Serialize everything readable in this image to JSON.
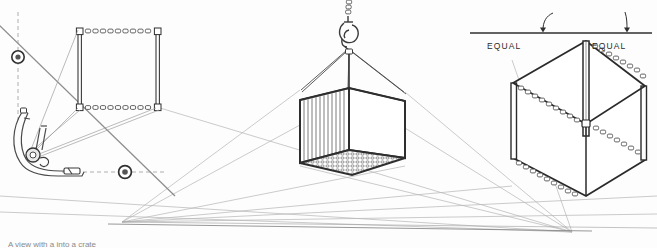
{
  "figure": {
    "background_color": "#fdfdfd",
    "ink_color": "#3a3a3a",
    "light_ink_color": "#9a9a9a",
    "width": 657,
    "height": 248
  },
  "labels": {
    "equal_left": "EQUAL",
    "equal_right": "EQUAL",
    "caption": "A view with a into a crate"
  },
  "panels": {
    "left": {
      "name": "sling-geometry-panel",
      "marker_upper": {
        "x": 18,
        "y": 57,
        "label": "vanishing-trace-marker"
      },
      "marker_lower": {
        "x": 125,
        "y": 172,
        "label": "vanishing-trace-marker"
      },
      "chain_rect": {
        "x": 78,
        "y": 30,
        "w": 82,
        "h": 78
      }
    },
    "center": {
      "name": "suspended-crate-panel",
      "hook": {
        "x": 348,
        "y": 22
      },
      "crate": {
        "x": 300,
        "y": 88,
        "w": 105,
        "h": 78
      }
    },
    "right": {
      "name": "equal-chain-cube-panel",
      "reference_line_y": 33,
      "cube": {
        "x": 512,
        "y": 38,
        "w": 128,
        "h": 155
      }
    }
  },
  "vanishing_points": [
    {
      "name": "left-vanishing-point",
      "x": 122,
      "y": 222
    },
    {
      "name": "right-vanishing-point",
      "x": 572,
      "y": 232
    }
  ]
}
